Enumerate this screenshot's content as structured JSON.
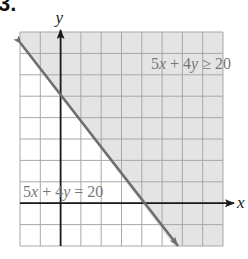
{
  "problem": {
    "number": "3."
  },
  "chart_data": {
    "type": "line",
    "title": "",
    "xlabel": "x",
    "ylabel": "y",
    "xlim": [
      -2,
      8
    ],
    "ylim": [
      -2,
      8
    ],
    "grid": true,
    "grid_step": 1,
    "boundary": {
      "equation": "5x + 4y = 20",
      "style": "solid",
      "points": [
        [
          -2,
          7.5
        ],
        [
          5.6,
          -2
        ]
      ],
      "x_intercept": 4,
      "y_intercept": 5
    },
    "inequality": {
      "label": "5x + 4y ≥ 20",
      "shaded_region": "above-right of line"
    },
    "annotations": [
      {
        "text": "5x + 4y ≥ 20",
        "x": 4.5,
        "y": 6.5
      },
      {
        "text": "5x + 4y = 20",
        "x": -1.9,
        "y": 0.4
      }
    ]
  },
  "labels": {
    "x_axis": "x",
    "y_axis": "y",
    "inequality": "5x + 4y ≥ 20",
    "boundary": "5x + 4y = 20"
  },
  "colors": {
    "shade": "#e4e4e4",
    "grid": "#a8a8a8",
    "axis": "#1a1a1a",
    "boundary_line": "#6e6e6e",
    "label_text": "#777777"
  }
}
